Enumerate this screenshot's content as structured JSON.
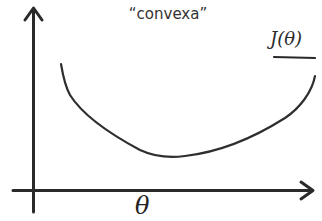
{
  "diagram": {
    "title": "“convexa”",
    "function_label": "J(θ)",
    "x_axis_label": "θ",
    "colors": {
      "background": "#ffffff",
      "ink": "#2a2a2a",
      "text": "#333333"
    },
    "axes": {
      "y_axis": {
        "x": 33.5,
        "y_top": 8,
        "y_bottom": 212,
        "arrow": "up"
      },
      "x_axis": {
        "y": 190.5,
        "x_left": 13,
        "x_right": 313,
        "arrow": "right"
      }
    },
    "curve": {
      "description": "hand-drawn convex U-shaped curve of J(theta)",
      "points": [
        [
          61,
          64
        ],
        [
          68,
          92
        ],
        [
          85,
          112
        ],
        [
          110,
          132
        ],
        [
          145,
          152
        ],
        [
          175,
          157
        ],
        [
          215,
          151
        ],
        [
          255,
          135
        ],
        [
          290,
          113
        ],
        [
          308,
          95
        ],
        [
          315,
          76
        ]
      ]
    }
  }
}
